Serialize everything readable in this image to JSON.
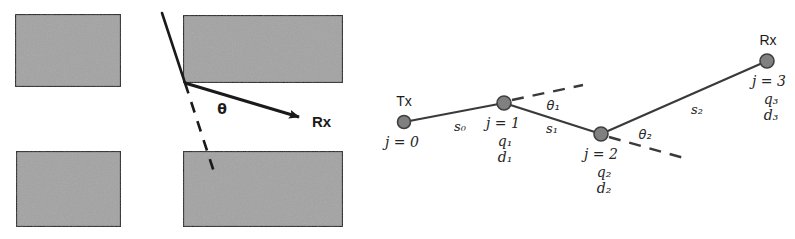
{
  "figure": {
    "background": "#ffffff",
    "colors": {
      "block_fill": "#a3a3a3",
      "block_edge": "#1a1a1a",
      "ray": "#1a1a1a",
      "path_line": "#3a3a3a",
      "node_fill": "#808080",
      "node_edge": "#3f3f3f",
      "text": "#1a1a1a"
    }
  },
  "left_panel": {
    "name": "wedge-diffraction-diagram",
    "blocks": [
      {
        "name": "block-top-left",
        "x": 15,
        "y": 14,
        "w": 106,
        "h": 73
      },
      {
        "name": "block-bottom-left",
        "x": 16,
        "y": 151,
        "w": 105,
        "h": 76
      },
      {
        "name": "block-top-right",
        "x": 183,
        "y": 15,
        "w": 157,
        "h": 68
      },
      {
        "name": "block-bottom-right",
        "x": 183,
        "y": 151,
        "w": 157,
        "h": 76
      }
    ],
    "incident_ray": {
      "x1": 162,
      "y1": 13,
      "x2": 185,
      "y2": 83
    },
    "diffracted_ray": {
      "x1": 185,
      "y1": 83,
      "x2": 303,
      "y2": 118
    },
    "shadow_boundary_dashed": {
      "x1": 185,
      "y1": 83,
      "x2": 214,
      "y2": 172
    },
    "angle_label": "θ",
    "angle_label_pos": {
      "x": 222,
      "y": 114
    },
    "rx_label": "Rx",
    "rx_label_pos": {
      "x": 312,
      "y": 127
    }
  },
  "right_panel": {
    "name": "multihop-ray-path-diagram",
    "endpoints": {
      "tx_label": "Tx",
      "rx_label": "Rx"
    },
    "nodes": [
      {
        "id": "n0",
        "cx": 404,
        "cy": 122,
        "r": 6.5,
        "endpoint_label": "Tx",
        "endpoint_pos": {
          "x": 400,
          "y": 105
        },
        "index_label": "j = 0",
        "index_pos": {
          "x": 399,
          "y": 146
        },
        "q_label": "",
        "d_label": ""
      },
      {
        "id": "n1",
        "cx": 504,
        "cy": 103,
        "r": 7,
        "endpoint_label": "",
        "endpoint_pos": {
          "x": 0,
          "y": 0
        },
        "index_label": "j = 1",
        "index_pos": {
          "x": 501,
          "y": 128
        },
        "q_label": "q₁",
        "q_pos": {
          "x": 503,
          "y": 146
        },
        "d_label": "d₁",
        "d_pos": {
          "x": 503,
          "y": 162
        }
      },
      {
        "id": "n2",
        "cx": 601,
        "cy": 134,
        "r": 7,
        "endpoint_label": "",
        "endpoint_pos": {
          "x": 0,
          "y": 0
        },
        "index_label": "j = 2",
        "index_pos": {
          "x": 601,
          "y": 159
        },
        "q_label": "q₂",
        "q_pos": {
          "x": 603,
          "y": 177
        },
        "d_label": "d₂",
        "d_pos": {
          "x": 603,
          "y": 193
        }
      },
      {
        "id": "n3",
        "cx": 767,
        "cy": 61,
        "r": 7,
        "endpoint_label": "Rx",
        "endpoint_pos": {
          "x": 763,
          "y": 44
        },
        "index_label": "j = 3",
        "index_pos": {
          "x": 766,
          "y": 86
        },
        "q_label": "q₃",
        "q_pos": {
          "x": 768,
          "y": 104
        },
        "d_label": "d₃",
        "d_pos": {
          "x": 768,
          "y": 120
        }
      }
    ],
    "segments": [
      {
        "name": "segment-s0",
        "from": "n0",
        "to": "n1",
        "label": "s₀",
        "label_pos": {
          "x": 460,
          "y": 131
        }
      },
      {
        "name": "segment-s1",
        "from": "n1",
        "to": "n2",
        "label": "s₁",
        "label_pos": {
          "x": 552,
          "y": 133
        }
      },
      {
        "name": "segment-s2",
        "from": "n2",
        "to": "n3",
        "label": "s₂",
        "label_pos": {
          "x": 697,
          "y": 114
        }
      }
    ],
    "dashed_extensions": [
      {
        "name": "extension-at-node-1",
        "x1": 512,
        "y1": 100,
        "x2": 583,
        "y2": 85
      },
      {
        "name": "extension-at-node-2",
        "x1": 609,
        "y1": 137,
        "x2": 684,
        "y2": 158
      }
    ],
    "angles": [
      {
        "name": "angle-theta-1",
        "label": "θ₁",
        "pos": {
          "x": 553,
          "y": 110
        }
      },
      {
        "name": "angle-theta-2",
        "label": "θ₂",
        "pos": {
          "x": 645,
          "y": 139
        }
      }
    ]
  }
}
